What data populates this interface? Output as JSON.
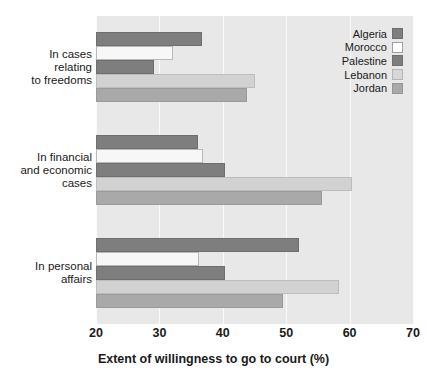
{
  "chart_data": {
    "type": "bar",
    "orientation": "horizontal",
    "title": "",
    "xlabel": "Extent of willingness to go to court (%)",
    "ylabel": "",
    "xlim": [
      20,
      70
    ],
    "xticks": [
      20,
      30,
      40,
      50,
      60,
      70
    ],
    "xtick_labels": [
      "20",
      "30",
      "40",
      "50",
      "60",
      "70"
    ],
    "grid": true,
    "grid_axis": "x",
    "legend_position": "top-right",
    "categories": [
      "In cases\nrelating\nto freedoms",
      "In financial\nand economic\ncases",
      "In personal\naffairs"
    ],
    "category_labels_flat": [
      "In cases relating to freedoms",
      "In financial and economic cases",
      "In personal affairs"
    ],
    "series": [
      {
        "name": "Algeria",
        "color": "#7e7e7e",
        "values": [
          36.7,
          36.1,
          52.0
        ]
      },
      {
        "name": "Morocco",
        "color": "#f7f7f7",
        "values": [
          32.1,
          36.9,
          36.3
        ]
      },
      {
        "name": "Palestine",
        "color": "#7e7e7e",
        "values": [
          29.2,
          40.4,
          40.4
        ]
      },
      {
        "name": "Lebanon",
        "color": "#d2d2d2",
        "values": [
          45.1,
          60.3,
          58.3
        ]
      },
      {
        "name": "Jordan",
        "color": "#a9a9a9",
        "values": [
          43.8,
          55.6,
          49.5
        ]
      }
    ],
    "plot_background": "#e8e8e8",
    "gridline_color": "#fafafa"
  },
  "legend": {
    "items": [
      {
        "label": "Algeria"
      },
      {
        "label": "Morocco"
      },
      {
        "label": "Palestine"
      },
      {
        "label": "Lebanon"
      },
      {
        "label": "Jordan"
      }
    ]
  }
}
